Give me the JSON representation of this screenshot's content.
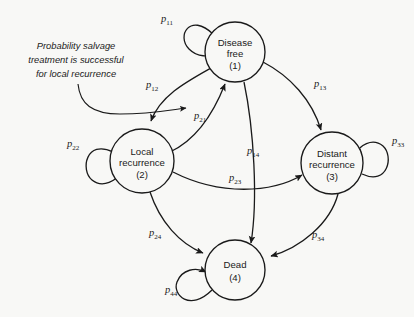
{
  "diagram": {
    "background_color": "#f8f8f6",
    "stroke_color": "#1a1a1a",
    "annotation": {
      "lines": [
        "Probability salvage",
        "treatment is successful",
        "for local recurrence"
      ],
      "style": "italic",
      "points_to": "p21"
    },
    "states": [
      {
        "id": "1",
        "name": "disease-free",
        "line1": "Disease",
        "line2": "free",
        "index": "(1)",
        "cx": 235,
        "cy": 52,
        "r": 30
      },
      {
        "id": "2",
        "name": "local-recurrence",
        "line1": "Local",
        "line2": "recurrence",
        "index": "(2)",
        "cx": 142,
        "cy": 161,
        "r": 32
      },
      {
        "id": "3",
        "name": "distant-recurrence",
        "line1": "Distant",
        "line2": "recurrence",
        "index": "(3)",
        "cx": 332,
        "cy": 163,
        "r": 31
      },
      {
        "id": "4",
        "name": "dead",
        "line1": "Dead",
        "line2": "",
        "index": "(4)",
        "cx": 235,
        "cy": 270,
        "r": 30
      }
    ],
    "transitions": [
      {
        "name": "p11",
        "base": "p",
        "sub": "11",
        "from": "1",
        "to": "1",
        "type": "self-loop",
        "lx": 167,
        "ly": 20
      },
      {
        "name": "p12",
        "base": "p",
        "sub": "12",
        "from": "1",
        "to": "2",
        "type": "arc",
        "lx": 152,
        "ly": 86
      },
      {
        "name": "p13",
        "base": "p",
        "sub": "13",
        "from": "1",
        "to": "3",
        "type": "arc",
        "lx": 320,
        "ly": 85
      },
      {
        "name": "p14",
        "base": "p",
        "sub": "14",
        "from": "1",
        "to": "4",
        "type": "arc",
        "lx": 253,
        "ly": 152
      },
      {
        "name": "p21",
        "base": "p",
        "sub": "21",
        "from": "2",
        "to": "1",
        "type": "arc",
        "lx": 200,
        "ly": 117
      },
      {
        "name": "p22",
        "base": "p",
        "sub": "22",
        "from": "2",
        "to": "2",
        "type": "self-loop",
        "lx": 73,
        "ly": 145
      },
      {
        "name": "p23",
        "base": "p",
        "sub": "23",
        "from": "2",
        "to": "3",
        "type": "arc",
        "lx": 235,
        "ly": 179
      },
      {
        "name": "p24",
        "base": "p",
        "sub": "24",
        "from": "2",
        "to": "4",
        "type": "arc",
        "lx": 155,
        "ly": 234
      },
      {
        "name": "p33",
        "base": "p",
        "sub": "33",
        "from": "3",
        "to": "3",
        "type": "self-loop",
        "lx": 398,
        "ly": 142
      },
      {
        "name": "p34",
        "base": "p",
        "sub": "34",
        "from": "3",
        "to": "4",
        "type": "arc",
        "lx": 318,
        "ly": 236
      },
      {
        "name": "p44",
        "base": "p",
        "sub": "44",
        "from": "4",
        "to": "4",
        "type": "self-loop",
        "lx": 171,
        "ly": 291
      }
    ]
  }
}
